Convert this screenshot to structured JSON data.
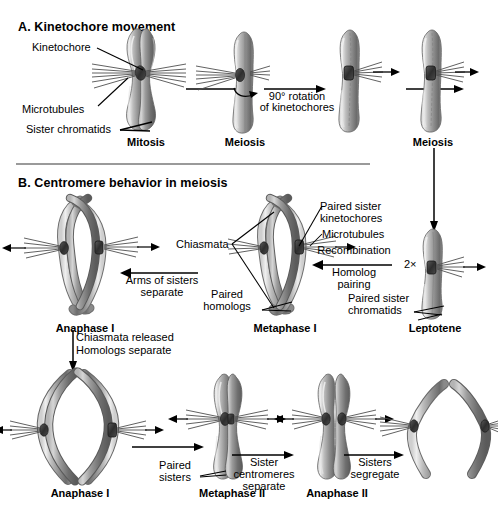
{
  "figure": {
    "type": "biology-diagram"
  },
  "panelA": {
    "title": "A. Kinetochore movement",
    "labels": {
      "kinetochore": "Kinetochore",
      "microtubules": "Microtubules",
      "sister_chromatids": "Sister chromatids"
    },
    "stages": [
      {
        "name": "Mitosis"
      },
      {
        "name": "Meiosis"
      },
      {
        "name": ""
      },
      {
        "name": "Meiosis"
      }
    ],
    "arrows": [
      {
        "label_line1": "",
        "label_line2": ""
      },
      {
        "label_line1": "90° rotation",
        "label_line2": "of kinetochores"
      },
      {
        "label_line1": "",
        "label_line2": ""
      }
    ]
  },
  "panelB": {
    "title": "B. Centromere behavior in meiosis",
    "stages": [
      {
        "name": "Anaphase I"
      },
      {
        "name": "Metaphase I"
      },
      {
        "name": "Leptotene"
      },
      {
        "name": "Anaphase I"
      },
      {
        "name": "Metaphase II"
      },
      {
        "name": "Anaphase II"
      }
    ],
    "labels": {
      "chiasmata": "Chiasmata",
      "paired_sister_kinetochores_line1": "Paired sister",
      "paired_sister_kinetochores_line2": "kinetochores",
      "microtubules": "Microtubules",
      "paired_homologs_line1": "Paired",
      "paired_homologs_line2": "homologs",
      "paired_sister_chromatids_line1": "Paired sister",
      "paired_sister_chromatids_line2": "chromatids",
      "paired_sisters_line1": "Paired",
      "paired_sisters_line2": "sisters",
      "multiplier": "2×"
    },
    "arrows": [
      {
        "label_line1": "Arms of sisters",
        "label_line2": "separate"
      },
      {
        "label_line1": "Recombination",
        "label_line2": "Homolog",
        "label_line3": "pairing"
      },
      {
        "label_line1": "Chiasmata released",
        "label_line2": "Homologs separate"
      },
      {
        "label_line1": "Sister",
        "label_line2": "centromeres",
        "label_line3": "separate"
      },
      {
        "label_line1": "Sisters",
        "label_line2": "segregate"
      }
    ]
  },
  "colors": {
    "chromatid_light": "#d8d8d8",
    "chromatid_mid": "#a8a8a8",
    "chromatid_dark": "#6e6e6e",
    "chromatid_shadow": "#4a4a4a",
    "kinetochore": "#3a3a3a",
    "microtubule": "#555555",
    "text": "#000000",
    "divider": "#9a9a9a",
    "background": "#ffffff"
  }
}
